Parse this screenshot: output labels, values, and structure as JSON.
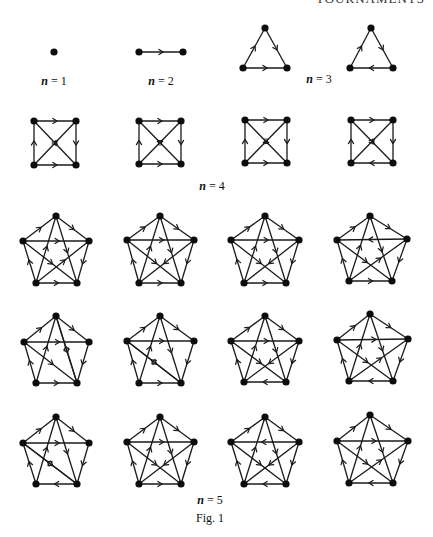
{
  "page": {
    "running_header": "TOURNAMENTS",
    "caption": "Fig. 1"
  },
  "labels": [
    {
      "id": "n1",
      "var": "n",
      "text": " = 1",
      "x": 54,
      "y": 74
    },
    {
      "id": "n2",
      "var": "n",
      "text": " = 2",
      "x": 161,
      "y": 74
    },
    {
      "id": "n3",
      "var": "n",
      "text": " = 3",
      "x": 319,
      "y": 72
    },
    {
      "id": "n4",
      "var": "n",
      "text": " = 4",
      "x": 212,
      "y": 179
    },
    {
      "id": "n5",
      "var": "n",
      "text": " = 5",
      "x": 210,
      "y": 493
    },
    {
      "id": "fig",
      "var": "",
      "text": "Fig. 1",
      "x": 210,
      "y": 511
    }
  ],
  "style": {
    "ink": "#0d0d0d",
    "background": "#ffffff",
    "vertex_radius": 3.6
  },
  "graphs": [
    {
      "group": "n=1",
      "vertices": [
        [
          54,
          52
        ]
      ],
      "edges": []
    },
    {
      "group": "n=2",
      "vertices": [
        [
          139,
          52
        ],
        [
          183,
          52
        ]
      ],
      "edges": [
        [
          0,
          1
        ]
      ]
    },
    {
      "group": "n=3",
      "vertices": [
        [
          265,
          28
        ],
        [
          287,
          68
        ],
        [
          243,
          68
        ]
      ],
      "edges": [
        [
          0,
          1
        ],
        [
          2,
          0
        ],
        [
          2,
          1
        ]
      ]
    },
    {
      "group": "n=3",
      "vertices": [
        [
          371,
          28
        ],
        [
          393,
          68
        ],
        [
          350,
          68
        ]
      ],
      "edges": [
        [
          0,
          1
        ],
        [
          2,
          0
        ],
        [
          1,
          2
        ]
      ]
    },
    {
      "group": "n=4",
      "vertices": [
        [
          34,
          121
        ],
        [
          76,
          121
        ],
        [
          76,
          165
        ],
        [
          34,
          165
        ]
      ],
      "edges": [
        [
          0,
          1
        ],
        [
          1,
          2
        ],
        [
          3,
          2
        ],
        [
          3,
          0
        ],
        [
          0,
          2
        ],
        [
          3,
          1
        ]
      ]
    },
    {
      "group": "n=4",
      "vertices": [
        [
          139,
          121
        ],
        [
          181,
          121
        ],
        [
          181,
          164
        ],
        [
          139,
          164
        ]
      ],
      "edges": [
        [
          0,
          1
        ],
        [
          1,
          2
        ],
        [
          3,
          2
        ],
        [
          3,
          0
        ],
        [
          2,
          0
        ],
        [
          3,
          1
        ]
      ]
    },
    {
      "group": "n=4",
      "vertices": [
        [
          245,
          120
        ],
        [
          287,
          120
        ],
        [
          287,
          163
        ],
        [
          245,
          163
        ]
      ],
      "edges": [
        [
          0,
          1
        ],
        [
          1,
          2
        ],
        [
          3,
          2
        ],
        [
          3,
          0
        ],
        [
          0,
          2
        ],
        [
          1,
          3
        ]
      ]
    },
    {
      "group": "n=4",
      "vertices": [
        [
          351,
          120
        ],
        [
          393,
          120
        ],
        [
          393,
          163
        ],
        [
          351,
          163
        ]
      ],
      "edges": [
        [
          0,
          1
        ],
        [
          1,
          2
        ],
        [
          2,
          3
        ],
        [
          3,
          0
        ],
        [
          0,
          2
        ],
        [
          3,
          1
        ]
      ]
    },
    {
      "group": "n=5",
      "vertices": [
        [
          56,
          216
        ],
        [
          89,
          241
        ],
        [
          77,
          283
        ],
        [
          36,
          283
        ],
        [
          23,
          241
        ]
      ],
      "edges": [
        [
          0,
          1
        ],
        [
          4,
          0
        ],
        [
          4,
          1
        ],
        [
          3,
          2
        ],
        [
          3,
          4
        ],
        [
          1,
          2
        ],
        [
          0,
          2
        ],
        [
          3,
          0
        ],
        [
          4,
          2
        ],
        [
          3,
          1
        ]
      ]
    },
    {
      "group": "n=5",
      "vertices": [
        [
          160,
          216
        ],
        [
          194,
          240
        ],
        [
          181,
          283
        ],
        [
          139,
          283
        ],
        [
          127,
          240
        ]
      ],
      "edges": [
        [
          0,
          1
        ],
        [
          4,
          0
        ],
        [
          4,
          1
        ],
        [
          3,
          2
        ],
        [
          3,
          4
        ],
        [
          1,
          2
        ],
        [
          0,
          2
        ],
        [
          3,
          0
        ],
        [
          4,
          2
        ],
        [
          1,
          3
        ]
      ]
    },
    {
      "group": "n=5",
      "vertices": [
        [
          265,
          216
        ],
        [
          299,
          240
        ],
        [
          286,
          283
        ],
        [
          244,
          283
        ],
        [
          231,
          240
        ]
      ],
      "edges": [
        [
          0,
          1
        ],
        [
          4,
          0
        ],
        [
          4,
          1
        ],
        [
          3,
          2
        ],
        [
          3,
          4
        ],
        [
          1,
          2
        ],
        [
          0,
          2
        ],
        [
          3,
          0
        ],
        [
          4,
          2
        ],
        [
          1,
          3
        ]
      ]
    },
    {
      "group": "n=5",
      "vertices": [
        [
          370,
          216
        ],
        [
          407,
          239
        ],
        [
          392,
          281
        ],
        [
          349,
          281
        ],
        [
          337,
          240
        ]
      ],
      "edges": [
        [
          0,
          1
        ],
        [
          4,
          0
        ],
        [
          1,
          4
        ],
        [
          3,
          2
        ],
        [
          3,
          4
        ],
        [
          1,
          2
        ],
        [
          0,
          2
        ],
        [
          3,
          0
        ],
        [
          4,
          2
        ],
        [
          3,
          1
        ]
      ]
    },
    {
      "group": "n=5",
      "vertices": [
        [
          56,
          316
        ],
        [
          89,
          342
        ],
        [
          77,
          383
        ],
        [
          36,
          383
        ],
        [
          24,
          342
        ]
      ],
      "edges": [
        [
          0,
          1
        ],
        [
          4,
          0
        ],
        [
          4,
          1
        ],
        [
          3,
          2
        ],
        [
          3,
          4
        ],
        [
          1,
          2
        ],
        [
          0,
          2
        ],
        [
          3,
          0
        ],
        [
          4,
          2
        ],
        [
          2,
          0
        ]
      ]
    },
    {
      "group": "n=5",
      "vertices": [
        [
          160,
          316
        ],
        [
          194,
          341
        ],
        [
          181,
          383
        ],
        [
          139,
          383
        ],
        [
          127,
          341
        ]
      ],
      "edges": [
        [
          0,
          1
        ],
        [
          4,
          0
        ],
        [
          4,
          1
        ],
        [
          3,
          2
        ],
        [
          3,
          4
        ],
        [
          1,
          2
        ],
        [
          0,
          2
        ],
        [
          3,
          0
        ],
        [
          4,
          2
        ],
        [
          2,
          4
        ]
      ]
    },
    {
      "group": "n=5",
      "vertices": [
        [
          265,
          316
        ],
        [
          299,
          341
        ],
        [
          286,
          382
        ],
        [
          244,
          382
        ],
        [
          231,
          341
        ]
      ],
      "edges": [
        [
          0,
          1
        ],
        [
          4,
          0
        ],
        [
          4,
          1
        ],
        [
          2,
          3
        ],
        [
          3,
          4
        ],
        [
          1,
          2
        ],
        [
          0,
          2
        ],
        [
          3,
          0
        ],
        [
          4,
          2
        ],
        [
          1,
          3
        ]
      ]
    },
    {
      "group": "n=5",
      "vertices": [
        [
          370,
          314
        ],
        [
          408,
          339
        ],
        [
          393,
          381
        ],
        [
          349,
          381
        ],
        [
          337,
          340
        ]
      ],
      "edges": [
        [
          0,
          1
        ],
        [
          4,
          0
        ],
        [
          4,
          1
        ],
        [
          2,
          3
        ],
        [
          3,
          4
        ],
        [
          1,
          2
        ],
        [
          0,
          2
        ],
        [
          3,
          0
        ],
        [
          4,
          2
        ],
        [
          3,
          1
        ]
      ]
    },
    {
      "group": "n=5",
      "vertices": [
        [
          56,
          417
        ],
        [
          89,
          443
        ],
        [
          77,
          484
        ],
        [
          36,
          484
        ],
        [
          23,
          443
        ]
      ],
      "edges": [
        [
          0,
          1
        ],
        [
          4,
          0
        ],
        [
          4,
          1
        ],
        [
          2,
          3
        ],
        [
          3,
          4
        ],
        [
          1,
          2
        ],
        [
          0,
          2
        ],
        [
          3,
          0
        ],
        [
          4,
          2
        ],
        [
          2,
          4
        ]
      ]
    },
    {
      "group": "n=5",
      "vertices": [
        [
          160,
          417
        ],
        [
          194,
          442
        ],
        [
          181,
          484
        ],
        [
          139,
          484
        ],
        [
          127,
          442
        ]
      ],
      "edges": [
        [
          0,
          1
        ],
        [
          4,
          0
        ],
        [
          4,
          1
        ],
        [
          3,
          2
        ],
        [
          3,
          4
        ],
        [
          1,
          2
        ],
        [
          0,
          2
        ],
        [
          3,
          0
        ],
        [
          4,
          2
        ],
        [
          1,
          3
        ]
      ]
    },
    {
      "group": "n=5",
      "vertices": [
        [
          265,
          417
        ],
        [
          299,
          442
        ],
        [
          286,
          484
        ],
        [
          244,
          484
        ],
        [
          231,
          442
        ]
      ],
      "edges": [
        [
          0,
          1
        ],
        [
          4,
          0
        ],
        [
          1,
          4
        ],
        [
          2,
          3
        ],
        [
          3,
          4
        ],
        [
          1,
          2
        ],
        [
          0,
          2
        ],
        [
          3,
          0
        ],
        [
          4,
          2
        ],
        [
          1,
          3
        ]
      ]
    },
    {
      "group": "n=5",
      "vertices": [
        [
          370,
          415
        ],
        [
          408,
          441
        ],
        [
          393,
          483
        ],
        [
          349,
          483
        ],
        [
          337,
          441
        ]
      ],
      "edges": [
        [
          0,
          1
        ],
        [
          4,
          0
        ],
        [
          4,
          1
        ],
        [
          2,
          3
        ],
        [
          3,
          4
        ],
        [
          1,
          2
        ],
        [
          0,
          2
        ],
        [
          3,
          0
        ],
        [
          4,
          2
        ],
        [
          3,
          1
        ]
      ]
    }
  ]
}
